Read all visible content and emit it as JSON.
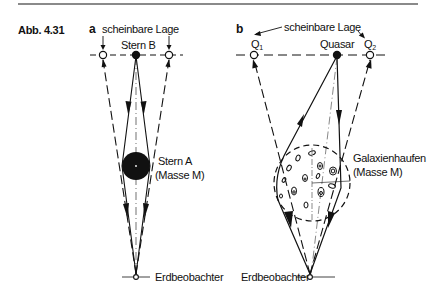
{
  "figure": {
    "number": "Abb. 4.31"
  },
  "panel_a": {
    "letter": "a",
    "apparent_position_label": "scheinbare Lage",
    "source_label": "Stern B",
    "lens_label_line1": "Stern A",
    "lens_label_line2": "(Masse M)",
    "observer_label": "Erdbeobachter"
  },
  "panel_b": {
    "letter": "b",
    "apparent_position_label": "scheinbare Lage",
    "image1_label": "Q",
    "image1_sub": "1",
    "source_label": "Quasar",
    "image2_label": "Q",
    "image2_sub": "2",
    "lens_label_line1": "Galaxienhaufen",
    "lens_label_line2": "(Masse M)",
    "observer_label": "Erdbeobachter"
  },
  "colors": {
    "ink": "#111111",
    "rule": "#8a8a8a",
    "background": "#ffffff"
  }
}
